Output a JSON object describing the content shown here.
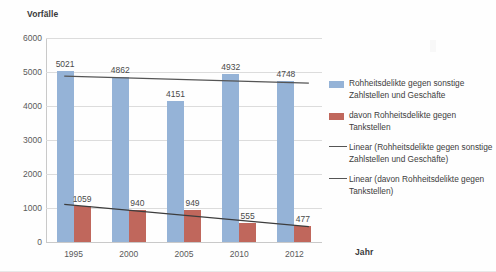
{
  "chart_data": {
    "type": "bar",
    "title": "",
    "subtitle": "",
    "xlabel": "Jahr",
    "ylabel": "Vorfälle",
    "categories": [
      "1995",
      "2000",
      "2005",
      "2010",
      "2012"
    ],
    "ylim": [
      0,
      6000
    ],
    "ytick_labels": [
      "6000",
      "5000",
      "4000",
      "3000",
      "2000",
      "1000",
      "0"
    ],
    "ytick_values": [
      6000,
      5000,
      4000,
      3000,
      2000,
      1000,
      0
    ],
    "grid": true,
    "legend_position": "right",
    "series": [
      {
        "name": "Rohheitsdelikte gegen sonstige Zahlstellen und Geschäfte",
        "type": "bar",
        "color": "#95b3d7",
        "values": [
          5021,
          4862,
          4151,
          4932,
          4748
        ],
        "labels": [
          "5021",
          "4862",
          "4151",
          "4932",
          "4748"
        ]
      },
      {
        "name": "davon Rohheitsdelikte gegen Tankstellen",
        "type": "bar",
        "color": "#c0675c",
        "values": [
          1059,
          940,
          949,
          555,
          477
        ],
        "labels": [
          "1059",
          "940",
          "949",
          "555",
          "477"
        ]
      },
      {
        "name": "Linear (Rohheitsdelikte gegen sonstige Zahlstellen und Geschäfte)",
        "type": "trendline",
        "color": "#555555",
        "endpoints": [
          4880,
          4670
        ]
      },
      {
        "name": "Linear (davon Rohheitsdelikte gegen Tankstellen)",
        "type": "trendline",
        "color": "#3d3d3d",
        "endpoints": [
          1105,
          455
        ]
      }
    ]
  },
  "legend": {
    "items": [
      {
        "marker": "blue-square",
        "label": "Rohheitsdelikte gegen sonstige Zahlstellen und Geschäfte"
      },
      {
        "marker": "red-square",
        "label": "davon Rohheitsdelikte gegen Tankstellen"
      },
      {
        "marker": "line",
        "label": "Linear (Rohheitsdelikte gegen sonstige Zahlstellen und Geschäfte)"
      },
      {
        "marker": "line",
        "label": "Linear (davon Rohheitsdelikte gegen Tankstellen)"
      }
    ]
  },
  "colors": {
    "primary_bar": "#95b3d7",
    "secondary_bar": "#c0675c",
    "gridline": "#dcdcdc",
    "axis": "#c9c9c9",
    "text": "#4a4a4a"
  }
}
